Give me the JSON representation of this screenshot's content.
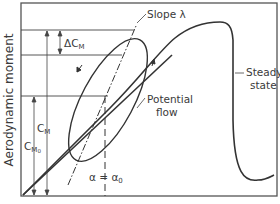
{
  "figure": {
    "type": "diagram",
    "y_axis_label": "Aerodynamic moment",
    "labels": {
      "slope": "Slope λ",
      "steady_state_line1": "Steady",
      "steady_state_line2": "state",
      "potential_line1": "Potential",
      "potential_line2": "flow",
      "alpha_eq": "α = α",
      "alpha_sub": "0",
      "delta_cm": "ΔC",
      "delta_cm_sub": "M",
      "cm": "C",
      "cm_sub": "M",
      "cm0": "C",
      "cm0_sub": "M",
      "cm0_subsub": "0"
    },
    "curves": [
      {
        "name": "steady-state",
        "description": "Moment rises with angle of attack, peaks near top, drops sharply at stall, then levels off"
      },
      {
        "name": "potential-flow",
        "description": "Straight line from origin with constant slope"
      },
      {
        "name": "hysteresis-loop",
        "description": "Elliptical dynamic loop centered on alpha = alpha0, with arrows showing counter-clockwise traversal"
      },
      {
        "name": "slope-line",
        "description": "Dash-dot line through the loop with slope lambda"
      }
    ],
    "colors": {
      "ink": "#3a3a3a",
      "frame": "#555555",
      "background": "#ffffff"
    }
  }
}
